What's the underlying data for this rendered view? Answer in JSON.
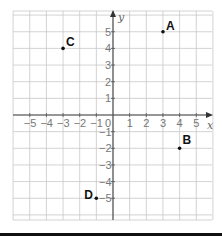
{
  "diagram": {
    "type": "coordinate-grid",
    "x_axis": {
      "label": "x",
      "min": -6,
      "max": 6,
      "ticks": [
        -5,
        -4,
        -3,
        -2,
        -1,
        1,
        2,
        3,
        4,
        5
      ],
      "tick_labels": [
        "−5",
        "−4",
        "−3",
        "−2",
        "−1",
        "1",
        "2",
        "3",
        "4",
        "5"
      ]
    },
    "y_axis": {
      "label": "y",
      "min": -6,
      "max": 6,
      "ticks": [
        5,
        4,
        3,
        2,
        1,
        -1,
        -2,
        -3,
        -4,
        -5
      ],
      "tick_labels": [
        "5",
        "4",
        "3",
        "2",
        "1",
        "−1",
        "−2",
        "−3",
        "−4",
        "−5"
      ]
    },
    "origin_label": "0",
    "points": [
      {
        "name": "A",
        "x": 3,
        "y": 5
      },
      {
        "name": "B",
        "x": 4,
        "y": -2
      },
      {
        "name": "C",
        "x": -3,
        "y": 4
      },
      {
        "name": "D",
        "x": -1,
        "y": -5
      }
    ],
    "colors": {
      "grid": "#c8c8c8",
      "axis": "#444444",
      "point": "#111111",
      "tick_text": "#777777"
    }
  }
}
